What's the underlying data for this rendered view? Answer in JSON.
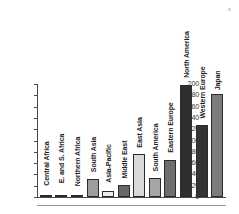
{
  "chart_data": {
    "type": "bar",
    "title": "",
    "subtitle": "",
    "xlabel": "",
    "ylabel": "",
    "ylim": [
      0,
      200
    ],
    "grid": false,
    "legend": "none",
    "yticks": [
      200,
      180,
      160,
      140,
      120,
      100,
      80,
      60,
      40,
      20,
      0
    ],
    "categories": [
      "Central Africa",
      "E. and S. Africa",
      "Northern Africa",
      "South Asia",
      "Asia-Pacific",
      "Middle East",
      "East Asia",
      "South America",
      "Eastern Europe",
      "North America",
      "Western Europe",
      "Japan"
    ],
    "values": [
      2,
      1,
      1,
      32,
      10,
      21,
      76,
      34,
      65,
      199,
      127,
      182
    ],
    "bar_colors": [
      "#8d8d8d",
      "#8d8d8d",
      "#8d8d8d",
      "#9d9d9d",
      "#ededed",
      "#666666",
      "#d9d9d9",
      "#a5a5a5",
      "#6e6e6e",
      "#2e2e2e",
      "#343434",
      "#7c7c7c"
    ]
  },
  "axis": {
    "tick_color": "#4a4a4a",
    "label_color": "#3a3a3a"
  }
}
